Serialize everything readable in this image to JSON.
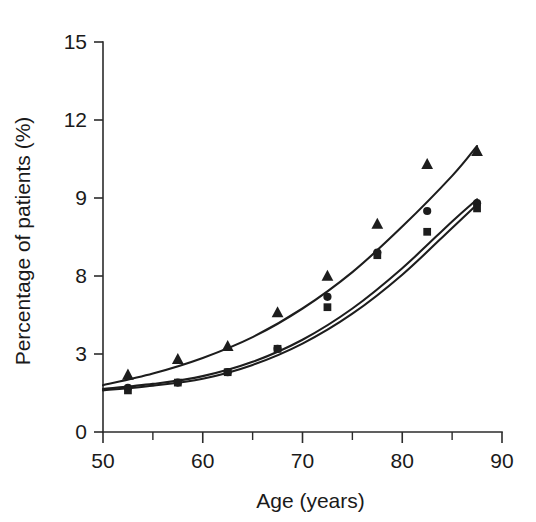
{
  "chart_data": {
    "type": "scatter",
    "title": "",
    "xlabel": "Age (years)",
    "ylabel": "Percentage of patients (%)",
    "xlim": [
      50,
      90
    ],
    "ylim": [
      0,
      15
    ],
    "grid": false,
    "legend": "none",
    "x_ticks": [
      50,
      60,
      70,
      80,
      90
    ],
    "x_tick_labels": [
      "50",
      "60",
      "70",
      "80",
      "90"
    ],
    "x_minor_ticks": [
      55,
      65,
      75,
      85
    ],
    "y_ticks": [
      0,
      3,
      8,
      9,
      12,
      15
    ],
    "y_tick_labels": [
      "0",
      "3",
      "8",
      "9",
      "12",
      "15"
    ],
    "x": [
      52.5,
      57.5,
      62.5,
      67.5,
      72.5,
      77.5,
      82.5,
      87.5
    ],
    "series": [
      {
        "name": "triangle-series",
        "marker": "triangle",
        "values": [
          2.2,
          2.8,
          3.3,
          4.6,
          6.0,
          8.0,
          10.3,
          10.8
        ]
      },
      {
        "name": "circle-series",
        "marker": "circle",
        "values": [
          1.7,
          1.9,
          2.3,
          3.2,
          5.2,
          6.9,
          8.5,
          8.8
        ]
      },
      {
        "name": "square-series",
        "marker": "square",
        "values": [
          1.6,
          1.9,
          2.3,
          3.2,
          4.8,
          6.8,
          7.7,
          8.6
        ]
      }
    ],
    "fit_curves": [
      {
        "name": "upper-fit-curve",
        "points": [
          [
            50,
            1.8
          ],
          [
            55,
            2.25
          ],
          [
            60,
            2.85
          ],
          [
            65,
            3.65
          ],
          [
            70,
            4.75
          ],
          [
            75,
            6.15
          ],
          [
            80,
            7.9
          ],
          [
            85,
            9.85
          ],
          [
            87.5,
            11.0
          ]
        ]
      },
      {
        "name": "middle-fit-curve",
        "points": [
          [
            50,
            1.65
          ],
          [
            55,
            1.85
          ],
          [
            60,
            2.15
          ],
          [
            65,
            2.7
          ],
          [
            70,
            3.55
          ],
          [
            75,
            4.75
          ],
          [
            80,
            6.3
          ],
          [
            85,
            8.1
          ],
          [
            87.5,
            8.95
          ]
        ]
      },
      {
        "name": "lower-fit-curve",
        "points": [
          [
            50,
            1.6
          ],
          [
            55,
            1.78
          ],
          [
            60,
            2.05
          ],
          [
            65,
            2.58
          ],
          [
            70,
            3.4
          ],
          [
            75,
            4.55
          ],
          [
            80,
            6.05
          ],
          [
            85,
            7.85
          ],
          [
            87.5,
            8.75
          ]
        ]
      }
    ]
  }
}
